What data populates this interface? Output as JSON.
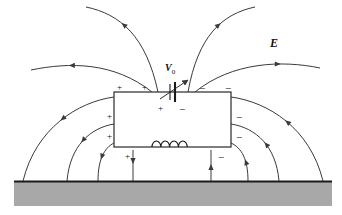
{
  "figure": {
    "name": "electric-field-lines-over-grounded-plane",
    "background_color": "#ffffff",
    "ground_color": "#a8a8a8",
    "line_color": "#3a3a3a",
    "ink_color": "#111111"
  },
  "labels": {
    "field_symbol": "E",
    "source_symbol": "V",
    "source_subscript": "0"
  },
  "box": {
    "name": "conducting-body",
    "x": 114,
    "y": 92,
    "width": 117,
    "height": 55,
    "fill": "#ffffff",
    "stroke": "#3a3a3a"
  },
  "ground": {
    "name": "ground-plane",
    "x": 14,
    "y": 181,
    "width": 318,
    "height": 25,
    "fill": "#a8a8a8",
    "top_edge_color": "#1a1a1a"
  },
  "battery": {
    "name": "variable-voltage-source",
    "x": 172,
    "y": 92,
    "type": "variable-dc-source",
    "has_arrow": true
  },
  "inductor": {
    "name": "inductor-coil",
    "x": 152,
    "y": 147,
    "loops": 4
  },
  "charge_signs": [
    {
      "sign": "+",
      "x": 117,
      "y": 83,
      "where": "above-box-left"
    },
    {
      "sign": "+",
      "x": 142,
      "y": 83,
      "where": "above-box-left"
    },
    {
      "sign": "−",
      "x": 199,
      "y": 83,
      "where": "above-box-right"
    },
    {
      "sign": "−",
      "x": 225,
      "y": 83,
      "where": "above-box-right"
    },
    {
      "sign": "+",
      "x": 107,
      "y": 112,
      "where": "left-of-box"
    },
    {
      "sign": "+",
      "x": 107,
      "y": 132,
      "where": "left-of-box"
    },
    {
      "sign": "+",
      "x": 125,
      "y": 152,
      "where": "below-box-left"
    },
    {
      "sign": "−",
      "x": 236,
      "y": 112,
      "where": "right-of-box"
    },
    {
      "sign": "−",
      "x": 236,
      "y": 132,
      "where": "right-of-box"
    },
    {
      "sign": "−",
      "x": 218,
      "y": 152,
      "where": "below-box-right"
    },
    {
      "sign": "+",
      "x": 158,
      "y": 104,
      "where": "inside-box-battery-left"
    },
    {
      "sign": "−",
      "x": 179,
      "y": 104,
      "where": "inside-box-battery-right"
    }
  ],
  "field_lines": [
    {
      "name": "field-line-top-left-far",
      "path": "M 86 7 C 120 14 146 36 158 92",
      "arrow_t": 0.33,
      "direction": "inward"
    },
    {
      "name": "field-line-top-left-near",
      "path": "M 31 70 C 70 62 114 62 152 92",
      "arrow_t": 0.3,
      "direction": "inward"
    },
    {
      "name": "field-line-top-right-far",
      "path": "M 255 7 C 222 14 198 36 188 92",
      "arrow_t": 0.33,
      "direction": "inward"
    },
    {
      "name": "field-line-top-right-near",
      "path": "M 320 68 C 282 60 232 62 195 92",
      "arrow_t": 0.3,
      "direction": "inward"
    },
    {
      "name": "field-line-left-1",
      "path": "M 114 97 C 78 102 36 128 23 181",
      "arrow_t": 0.45,
      "direction": "outward"
    },
    {
      "name": "field-line-left-2",
      "path": "M 114 124 C 90 128 70 146 67 181",
      "arrow_t": 0.48,
      "direction": "outward"
    },
    {
      "name": "field-line-left-3",
      "path": "M 114 143 C 104 148 98 160 98 181",
      "arrow_t": 0.5,
      "direction": "outward"
    },
    {
      "name": "field-line-left-4",
      "path": "M 133 150 C 133 160 133 170 133 181",
      "arrow_t": 0.45,
      "direction": "outward"
    },
    {
      "name": "field-line-right-1",
      "path": "M 231 97 C 268 102 310 128 323 181",
      "arrow_t": 0.45,
      "direction": "inward"
    },
    {
      "name": "field-line-right-2",
      "path": "M 231 124 C 256 128 276 146 279 181",
      "arrow_t": 0.48,
      "direction": "inward"
    },
    {
      "name": "field-line-right-3",
      "path": "M 231 143 C 242 148 248 160 248 181",
      "arrow_t": 0.5,
      "direction": "inward"
    },
    {
      "name": "field-line-right-4",
      "path": "M 211 150 C 211 160 211 170 211 181",
      "arrow_t": 0.45,
      "direction": "inward"
    }
  ]
}
